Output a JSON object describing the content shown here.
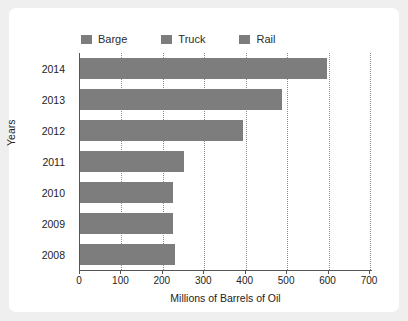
{
  "chart_data": {
    "type": "bar",
    "orientation": "horizontal",
    "title": "",
    "xlabel": "Millions of Barrels of Oil",
    "ylabel": "Years",
    "categories": [
      "2014",
      "2013",
      "2012",
      "2011",
      "2010",
      "2009",
      "2008"
    ],
    "values": [
      595,
      488,
      393,
      250,
      225,
      225,
      229
    ],
    "xlim": [
      0,
      700
    ],
    "xticks": [
      0,
      100,
      200,
      300,
      400,
      500,
      600,
      700
    ],
    "grid": "vertical-dotted",
    "legend_position": "top",
    "legend": [
      "Barge",
      "Truck",
      "Rail"
    ],
    "series": [
      {
        "name": "Barge",
        "values": [
          595,
          488,
          393,
          250,
          225,
          225,
          229
        ]
      }
    ]
  },
  "legend": {
    "items": [
      {
        "label": "Barge",
        "color": "#7d7d7d"
      },
      {
        "label": "Truck",
        "color": "#7d7d7d"
      },
      {
        "label": "Rail",
        "color": "#7d7d7d"
      }
    ]
  },
  "axes": {
    "y_title": "Years",
    "x_title": "Millions of Barrels of Oil",
    "x_ticks": [
      "0",
      "100",
      "200",
      "300",
      "400",
      "500",
      "600",
      "700"
    ],
    "y_ticks": [
      "2014",
      "2013",
      "2012",
      "2011",
      "2010",
      "2009",
      "2008"
    ]
  },
  "colors": {
    "bar": "#7d7d7d",
    "axis": "#555555",
    "grid": "#8b8b8b",
    "card": "#ffffff",
    "page": "#efefef",
    "text": "#232323"
  }
}
